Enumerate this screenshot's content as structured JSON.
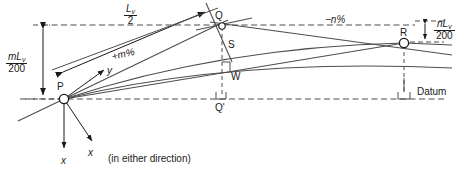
{
  "figure": {
    "type": "vertical-curve-setting-out-diagram",
    "background_color": "#ffffff",
    "line_color": "#4d4d4d",
    "text_color": "#1a1a1a"
  },
  "points": {
    "P": "P",
    "Q": "Q",
    "Q_prime": "Q'",
    "R": "R",
    "S": "S",
    "W": "W"
  },
  "dimensions": {
    "half_chord": {
      "numerator": "L",
      "subscript": "v",
      "denominator": "2"
    },
    "left_offset": {
      "numerator": "mL",
      "subscript": "v",
      "denominator": "200"
    },
    "right_offset": {
      "numerator": "nL",
      "subscript": "v",
      "denominator": "200"
    }
  },
  "gradients": {
    "entry": "+m%",
    "exit": "−n%"
  },
  "axes": {
    "y_label": "y",
    "x_label_1": "x",
    "x_label_2": "x",
    "x_note": "(in either direction)"
  },
  "datum": {
    "label": "Datum"
  }
}
